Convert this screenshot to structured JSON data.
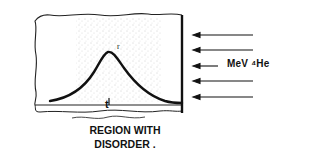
{
  "diagram": {
    "beam": {
      "label": "MeV ⁴He",
      "arrow_count": 5,
      "direction": "left"
    },
    "sample": {
      "depth_marker": "t",
      "peak_mark": "r"
    },
    "caption_line1": "REGION WITH",
    "caption_line2": "DISORDER",
    "caption_trailing": "."
  }
}
